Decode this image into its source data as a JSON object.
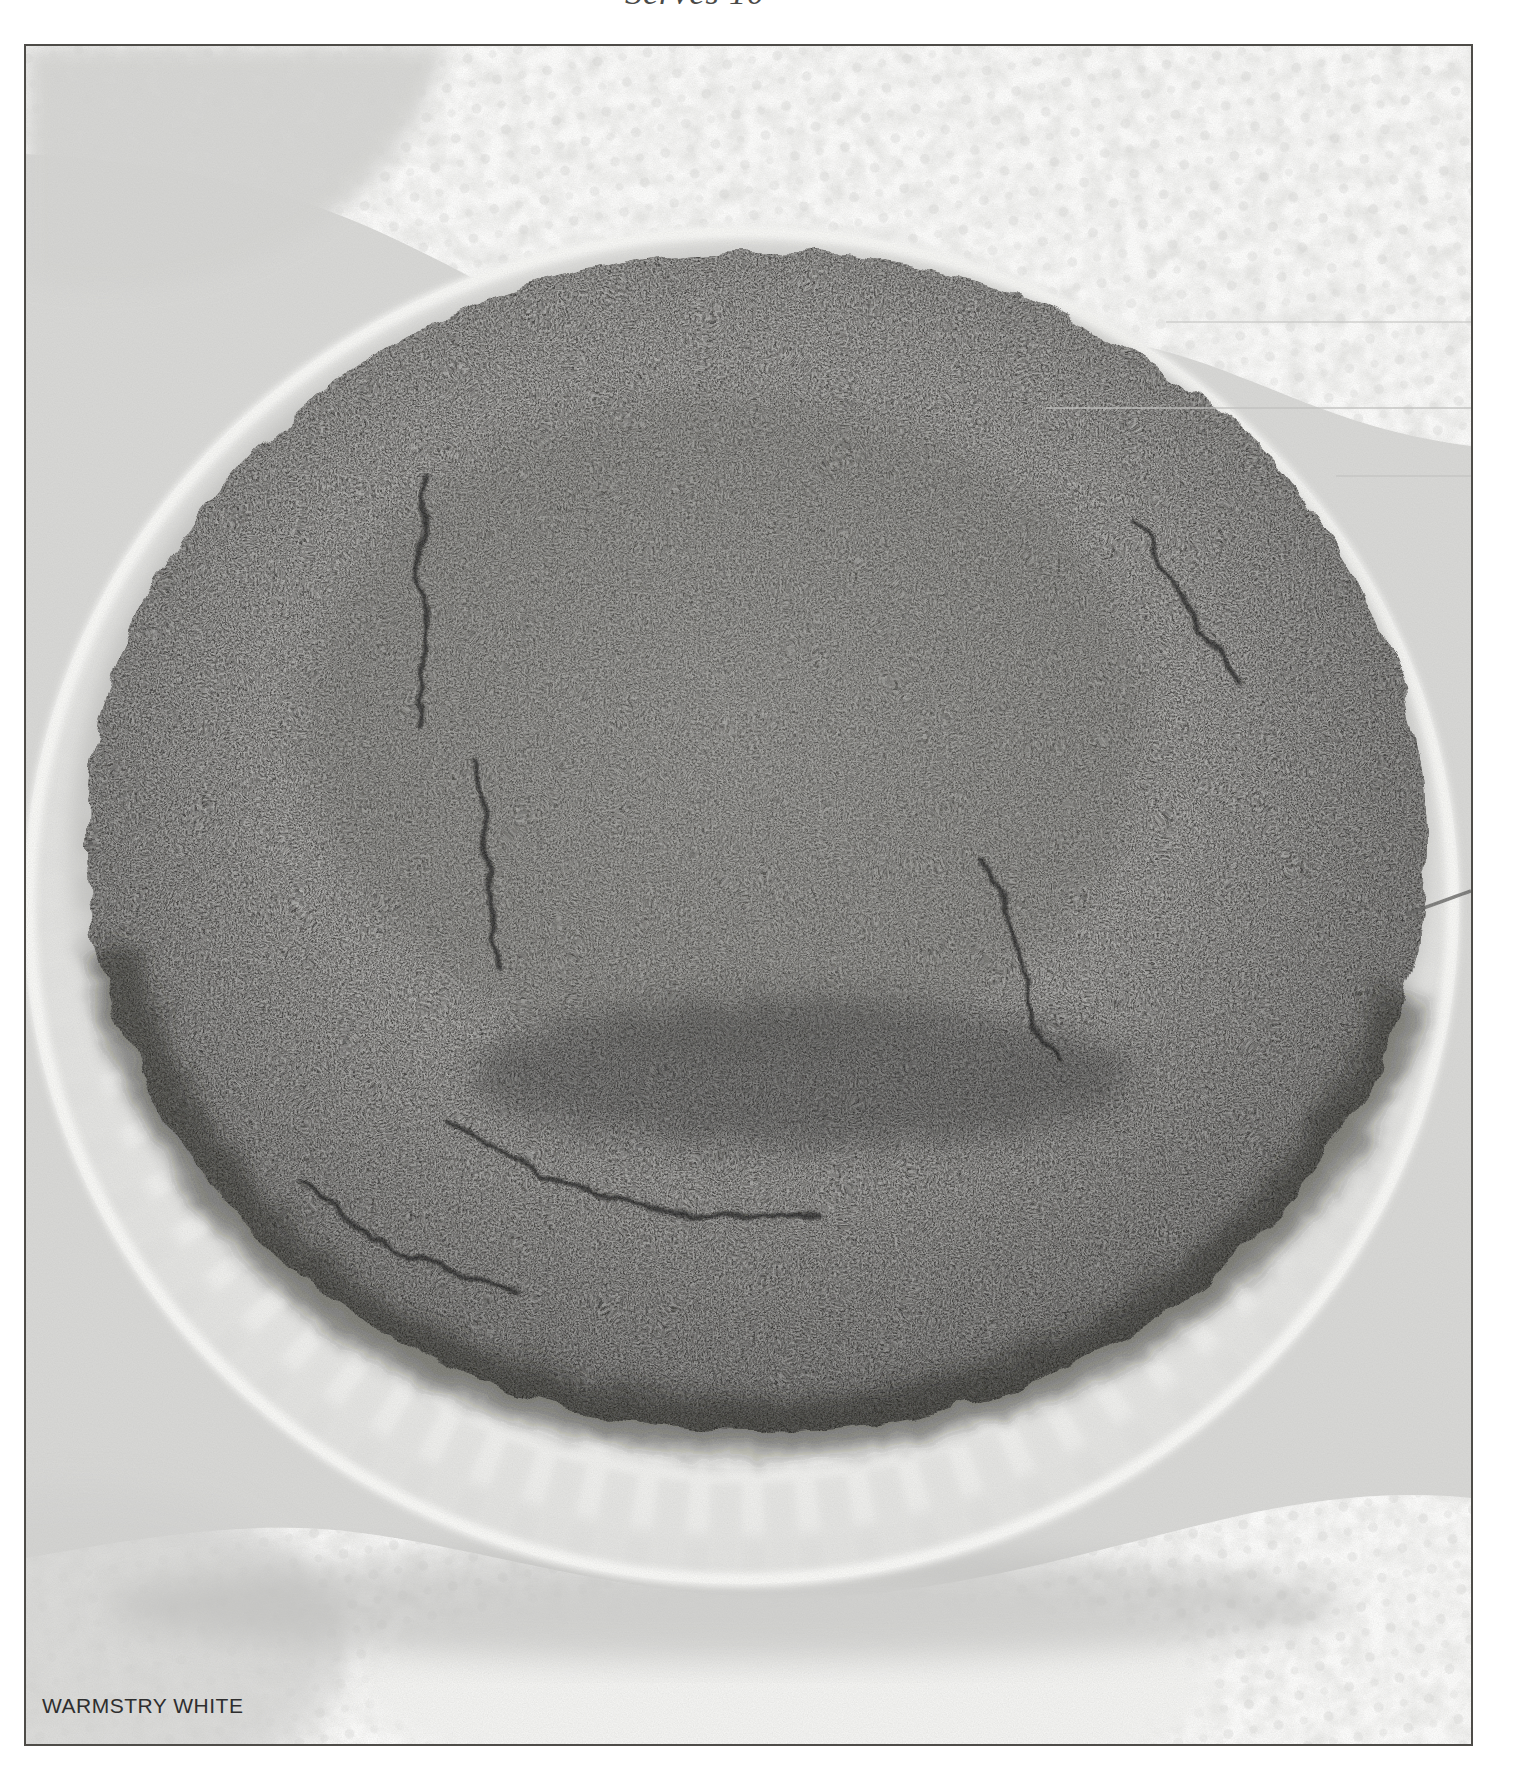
{
  "heading": {
    "serves_label": "Serves 10"
  },
  "photo": {
    "caption_label": "WARMSTRY WHITE",
    "alt": "Round dark crumb-topped cake on a white fluted plate set on a white lace doily"
  },
  "colors": {
    "page_background": "#ffffff",
    "photo_border": "#4e4c48",
    "photo_background": "#d7d7d5",
    "lace_doily": "#eaeae8",
    "plate_white": "#f3f3f1",
    "cake_base": "#403f3d",
    "cake_dark_pits": "#161614",
    "cake_light_crumbs": "#75746f",
    "caption_text": "#2e2e2e",
    "heading_text": "#4a4a48"
  }
}
